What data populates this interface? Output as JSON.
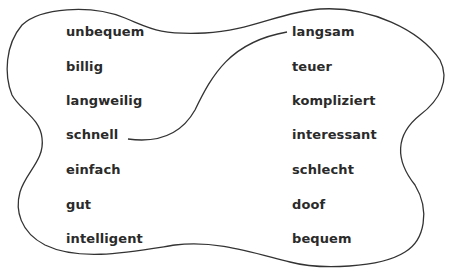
{
  "colors": {
    "stroke": "#333333",
    "text": "#2a2a2a",
    "background": "#ffffff"
  },
  "left_column": [
    {
      "word": "unbequem",
      "x": 66,
      "y": 24
    },
    {
      "word": "billig",
      "x": 66,
      "y": 59
    },
    {
      "word": "langweilig",
      "x": 66,
      "y": 93
    },
    {
      "word": "schnell",
      "x": 66,
      "y": 127
    },
    {
      "word": "einfach",
      "x": 66,
      "y": 162
    },
    {
      "word": "gut",
      "x": 66,
      "y": 197
    },
    {
      "word": "intelligent",
      "x": 66,
      "y": 231
    }
  ],
  "right_column": [
    {
      "word": "langsam",
      "x": 292,
      "y": 24
    },
    {
      "word": "teuer",
      "x": 292,
      "y": 59
    },
    {
      "word": "kompliziert",
      "x": 292,
      "y": 93
    },
    {
      "word": "interessant",
      "x": 292,
      "y": 127
    },
    {
      "word": "schlecht",
      "x": 292,
      "y": 162
    },
    {
      "word": "doof",
      "x": 292,
      "y": 197
    },
    {
      "word": "bequem",
      "x": 292,
      "y": 231
    }
  ],
  "connections": [
    {
      "from": "schnell",
      "to": "langsam"
    }
  ]
}
